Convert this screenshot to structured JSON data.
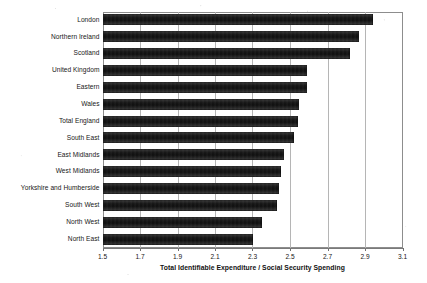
{
  "chart_data": {
    "type": "bar",
    "orientation": "horizontal",
    "title": "",
    "subtitle": "",
    "xlabel": "Total Identifiable Expenditure / Social Security Spending",
    "ylabel": "",
    "xlim": [
      1.5,
      3.1
    ],
    "xticks": [
      "1.5",
      "1.7",
      "1.9",
      "2.1",
      "2.3",
      "2.5",
      "2.7",
      "2.9",
      "3.1"
    ],
    "xtick_values": [
      1.5,
      1.7,
      1.9,
      2.1,
      2.3,
      2.5,
      2.7,
      2.9,
      3.1
    ],
    "grid": "vertical",
    "legend": "none",
    "bar_color": "#1a1a1a",
    "categories": [
      "London",
      "Northern Ireland",
      "Scotland",
      "United Kingdom",
      "Eastern",
      "Wales",
      "Total England",
      "South East",
      "East Midlands",
      "West Midlands",
      "Yorkshire and Humberside",
      "South West",
      "North West",
      "North East"
    ],
    "values": [
      2.94,
      2.87,
      2.82,
      2.59,
      2.59,
      2.55,
      2.54,
      2.52,
      2.47,
      2.45,
      2.44,
      2.43,
      2.35,
      2.3
    ]
  }
}
